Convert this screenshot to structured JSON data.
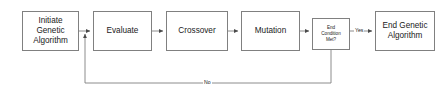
{
  "diagram": {
    "background_color": "#ffffff",
    "line_color": "#808080",
    "text_color": "#1a1a1a",
    "nodes": [
      {
        "id": "initiate",
        "label": "Initiate\nGenetic\nAlgorithm",
        "shape": "process",
        "x": 22,
        "y": 11,
        "w": 57,
        "h": 40
      },
      {
        "id": "evaluate",
        "label": "Evaluate",
        "shape": "process",
        "x": 93,
        "y": 11,
        "w": 59,
        "h": 40
      },
      {
        "id": "crossover",
        "label": "Crossover",
        "shape": "process",
        "x": 166,
        "y": 11,
        "w": 62,
        "h": 40
      },
      {
        "id": "mutation",
        "label": "Mutation",
        "shape": "process",
        "x": 241,
        "y": 11,
        "w": 59,
        "h": 40
      },
      {
        "id": "end_condition",
        "label": "End\nCondition\nMet?",
        "shape": "decision",
        "x": 312,
        "y": 18,
        "w": 38,
        "h": 32
      },
      {
        "id": "end_algorithm",
        "label": "End Genetic\nAlgorithm",
        "shape": "process",
        "x": 375,
        "y": 11,
        "w": 60,
        "h": 40
      }
    ],
    "edges": [
      {
        "id": "initiate-to-evaluate",
        "from": "initiate",
        "to": "evaluate",
        "label": ""
      },
      {
        "id": "evaluate-to-crossover",
        "from": "evaluate",
        "to": "crossover",
        "label": ""
      },
      {
        "id": "crossover-to-mutation",
        "from": "crossover",
        "to": "mutation",
        "label": ""
      },
      {
        "id": "mutation-to-end-condition",
        "from": "mutation",
        "to": "end_condition",
        "label": ""
      },
      {
        "id": "end-condition-to-end-algorithm",
        "from": "end_condition",
        "to": "end_algorithm",
        "label": "Yes"
      },
      {
        "id": "end-condition-feedback-to-evaluate",
        "from": "end_condition",
        "to": "evaluate",
        "label": "No"
      }
    ],
    "edge_labels": {
      "yes": "Yes",
      "no": "No"
    }
  }
}
